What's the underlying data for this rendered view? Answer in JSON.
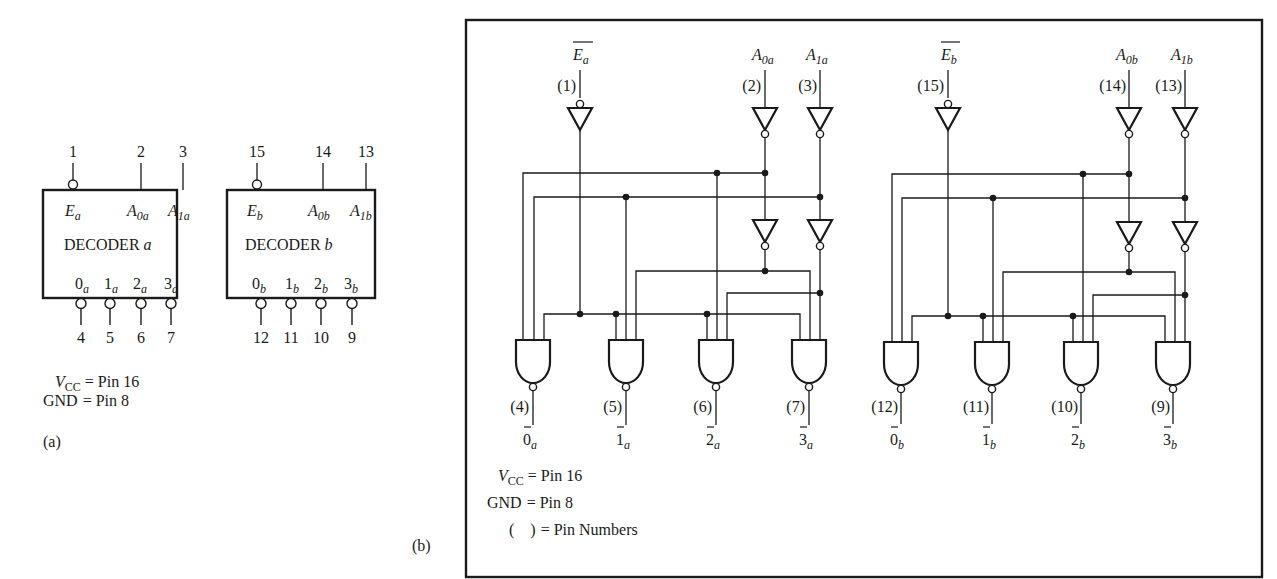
{
  "figure": {
    "panel_a": {
      "label": "(a)",
      "decoders": [
        {
          "id": "a",
          "title_prefix": "DECODER",
          "title_suffix": "a",
          "enable": {
            "pin": "1",
            "name": "E",
            "sub": "a"
          },
          "inputs": [
            {
              "pin": "2",
              "name": "A",
              "sub": "0a"
            },
            {
              "pin": "3",
              "name": "A",
              "sub": "1a"
            }
          ],
          "outputs": [
            {
              "name": "0",
              "sub": "a",
              "pin": "4"
            },
            {
              "name": "1",
              "sub": "a",
              "pin": "5"
            },
            {
              "name": "2",
              "sub": "a",
              "pin": "6"
            },
            {
              "name": "3",
              "sub": "a",
              "pin": "7"
            }
          ]
        },
        {
          "id": "b",
          "title_prefix": "DECODER",
          "title_suffix": "b",
          "enable": {
            "pin": "15",
            "name": "E",
            "sub": "b"
          },
          "inputs": [
            {
              "pin": "14",
              "name": "A",
              "sub": "0b"
            },
            {
              "pin": "13",
              "name": "A",
              "sub": "1b"
            }
          ],
          "outputs": [
            {
              "name": "0",
              "sub": "b",
              "pin": "12"
            },
            {
              "name": "1",
              "sub": "b",
              "pin": "11"
            },
            {
              "name": "2",
              "sub": "b",
              "pin": "10"
            },
            {
              "name": "3",
              "sub": "b",
              "pin": "9"
            }
          ]
        }
      ],
      "notes": {
        "vcc_label": "V",
        "vcc_sub": "CC",
        "vcc_value": "= Pin 16",
        "gnd_label": "GND",
        "gnd_value": "= Pin 8"
      }
    },
    "panel_b": {
      "label": "(b)",
      "sections": [
        {
          "id": "a",
          "enable": {
            "name": "E",
            "sub": "a",
            "pin": "(1)"
          },
          "inputs": [
            {
              "name": "A",
              "sub": "0a",
              "pin": "(2)"
            },
            {
              "name": "A",
              "sub": "1a",
              "pin": "(3)"
            }
          ],
          "outputs": [
            {
              "name": "0",
              "sub": "a",
              "pin": "(4)"
            },
            {
              "name": "1",
              "sub": "a",
              "pin": "(5)"
            },
            {
              "name": "2",
              "sub": "a",
              "pin": "(6)"
            },
            {
              "name": "3",
              "sub": "a",
              "pin": "(7)"
            }
          ]
        },
        {
          "id": "b",
          "enable": {
            "name": "E",
            "sub": "b",
            "pin": "(15)"
          },
          "inputs": [
            {
              "name": "A",
              "sub": "0b",
              "pin": "(14)"
            },
            {
              "name": "A",
              "sub": "1b",
              "pin": "(13)"
            }
          ],
          "outputs": [
            {
              "name": "0",
              "sub": "b",
              "pin": "(12)"
            },
            {
              "name": "1",
              "sub": "b",
              "pin": "(11)"
            },
            {
              "name": "2",
              "sub": "b",
              "pin": "(10)"
            },
            {
              "name": "3",
              "sub": "b",
              "pin": "(9)"
            }
          ]
        }
      ],
      "notes": {
        "vcc_label": "V",
        "vcc_sub": "CC",
        "vcc_value": "= Pin 16",
        "gnd_label": "GND",
        "gnd_value": "= Pin 8",
        "pin_symbol": "(    )",
        "pin_value": "= Pin Numbers"
      }
    }
  }
}
